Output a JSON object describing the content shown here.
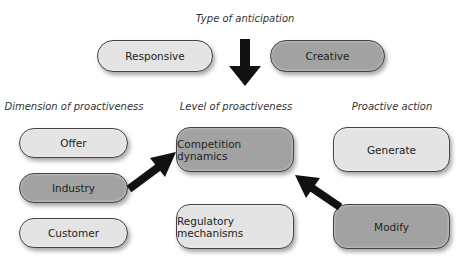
{
  "title": "Type of anticipation",
  "anticipation": {
    "responsive": "Responsive",
    "creative": "Creative"
  },
  "columns": {
    "dimension": "Dimension of proactiveness",
    "level": "Level of proactiveness",
    "action": "Proactive action"
  },
  "dimension_items": [
    "Offer",
    "Industry",
    "Customer"
  ],
  "level_items": [
    "Competition dynamics",
    "Regulatory mechanisms"
  ],
  "action_items": [
    "Generate",
    "Modify"
  ],
  "colors": {
    "light_fill": "#e4e4e4",
    "dark_fill": "#a2a2a2",
    "arrow": "#111111"
  }
}
